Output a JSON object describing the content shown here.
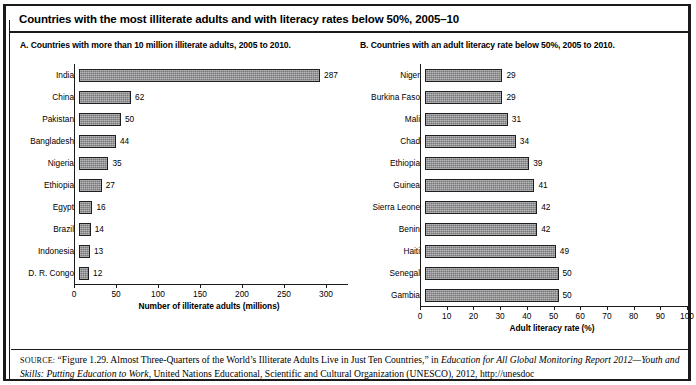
{
  "figure": {
    "title": "Countries with the most illiterate adults and with literacy rates below 50%, 2005–10"
  },
  "panel_a": {
    "subtitle": "A. Countries with more than 10 million illiterate adults, 2005 to 2010."
  },
  "panel_b": {
    "subtitle": "B. Countries with an adult literacy rate below 50%, 2005 to 2010."
  },
  "source": {
    "label": "SOURCE:",
    "line1_plain_a": " “Figure 1.29. Almost Three-Quarters of the World’s Illiterate Adults Live in Just Ten Countries,” in ",
    "line1_italic": "Education for All Global Monitoring Report 2012—Youth and Skills: Putting Education to Work",
    "line2_plain": ", United Nations Educational, Scientific and Cultural Organization (UNESCO), 2012, http://unesdoc"
  },
  "chart_data": [
    {
      "type": "bar",
      "orientation": "horizontal",
      "panel": "A",
      "title": "A. Countries with more than 10 million illiterate adults, 2005 to 2010.",
      "categories": [
        "India",
        "China",
        "Pakistan",
        "Bangladesh",
        "Nigeria",
        "Ethiopia",
        "Egypt",
        "Brazil",
        "Indonesia",
        "D. R. Congo"
      ],
      "values": [
        287,
        62,
        50,
        44,
        35,
        27,
        16,
        14,
        13,
        12
      ],
      "xlabel": "Number of illiterate adults (millions)",
      "ylabel": "",
      "xlim": [
        0,
        300
      ],
      "xticks": [
        0,
        50,
        100,
        150,
        200,
        250,
        300
      ],
      "grid": false,
      "legend": "none",
      "bar_color": "#77777a"
    },
    {
      "type": "bar",
      "orientation": "horizontal",
      "panel": "B",
      "title": "B. Countries with an adult literacy rate below 50%, 2005 to 2010.",
      "categories": [
        "Niger",
        "Burkina Faso",
        "Mali",
        "Chad",
        "Ethiopia",
        "Guinea",
        "Sierra Leone",
        "Benin",
        "Haiti",
        "Senegal",
        "Gambia"
      ],
      "values": [
        29,
        29,
        31,
        34,
        39,
        41,
        42,
        42,
        49,
        50,
        50
      ],
      "xlabel": "Adult literacy rate (%)",
      "ylabel": "",
      "xlim": [
        0,
        100
      ],
      "xticks": [
        0,
        10,
        20,
        30,
        40,
        50,
        60,
        70,
        80,
        90,
        100
      ],
      "grid": false,
      "legend": "none",
      "bar_color": "#77777a"
    }
  ]
}
